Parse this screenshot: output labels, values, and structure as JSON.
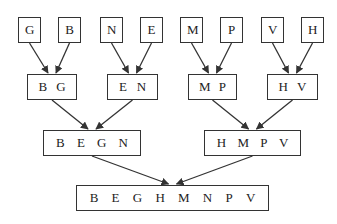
{
  "diagram": {
    "levels": [
      {
        "name": "level-0",
        "nodes": [
          {
            "id": "n0",
            "items": [
              "G"
            ],
            "x": 18,
            "y": 17,
            "w": 23,
            "h": 26
          },
          {
            "id": "n1",
            "items": [
              "B"
            ],
            "x": 58,
            "y": 17,
            "w": 23,
            "h": 26
          },
          {
            "id": "n2",
            "items": [
              "N"
            ],
            "x": 100,
            "y": 17,
            "w": 23,
            "h": 26
          },
          {
            "id": "n3",
            "items": [
              "E"
            ],
            "x": 140,
            "y": 17,
            "w": 23,
            "h": 26
          },
          {
            "id": "n4",
            "items": [
              "M"
            ],
            "x": 180,
            "y": 17,
            "w": 23,
            "h": 26
          },
          {
            "id": "n5",
            "items": [
              "P"
            ],
            "x": 220,
            "y": 17,
            "w": 23,
            "h": 26
          },
          {
            "id": "n6",
            "items": [
              "V"
            ],
            "x": 261,
            "y": 17,
            "w": 23,
            "h": 26
          },
          {
            "id": "n7",
            "items": [
              "H"
            ],
            "x": 301,
            "y": 17,
            "w": 23,
            "h": 26
          }
        ]
      },
      {
        "name": "level-1",
        "nodes": [
          {
            "id": "n8",
            "items": [
              "B",
              "G"
            ],
            "x": 27,
            "y": 74,
            "w": 50,
            "h": 26
          },
          {
            "id": "n9",
            "items": [
              "E",
              "N"
            ],
            "x": 107,
            "y": 74,
            "w": 51,
            "h": 26
          },
          {
            "id": "n10",
            "items": [
              "M",
              "P"
            ],
            "x": 188,
            "y": 74,
            "w": 49,
            "h": 26
          },
          {
            "id": "n11",
            "items": [
              "H",
              "V"
            ],
            "x": 267,
            "y": 74,
            "w": 51,
            "h": 26
          }
        ]
      },
      {
        "name": "level-2",
        "nodes": [
          {
            "id": "n12",
            "items": [
              "B",
              "E",
              "G",
              "N"
            ],
            "x": 43,
            "y": 130,
            "w": 98,
            "h": 26
          },
          {
            "id": "n13",
            "items": [
              "H",
              "M",
              "P",
              "V"
            ],
            "x": 204,
            "y": 130,
            "w": 97,
            "h": 26
          }
        ]
      },
      {
        "name": "level-3",
        "nodes": [
          {
            "id": "n14",
            "items": [
              "B",
              "E",
              "G",
              "H",
              "M",
              "N",
              "P",
              "V"
            ],
            "x": 76,
            "y": 185,
            "w": 193,
            "h": 26
          }
        ]
      }
    ],
    "edges": [
      [
        "n0",
        "n8"
      ],
      [
        "n1",
        "n8"
      ],
      [
        "n2",
        "n9"
      ],
      [
        "n3",
        "n9"
      ],
      [
        "n4",
        "n10"
      ],
      [
        "n5",
        "n10"
      ],
      [
        "n6",
        "n11"
      ],
      [
        "n7",
        "n11"
      ],
      [
        "n8",
        "n12"
      ],
      [
        "n9",
        "n12"
      ],
      [
        "n10",
        "n13"
      ],
      [
        "n11",
        "n13"
      ],
      [
        "n12",
        "n14"
      ],
      [
        "n13",
        "n14"
      ]
    ],
    "colors": {
      "stroke": "#333333",
      "text": "#222222",
      "background": "#ffffff"
    }
  }
}
